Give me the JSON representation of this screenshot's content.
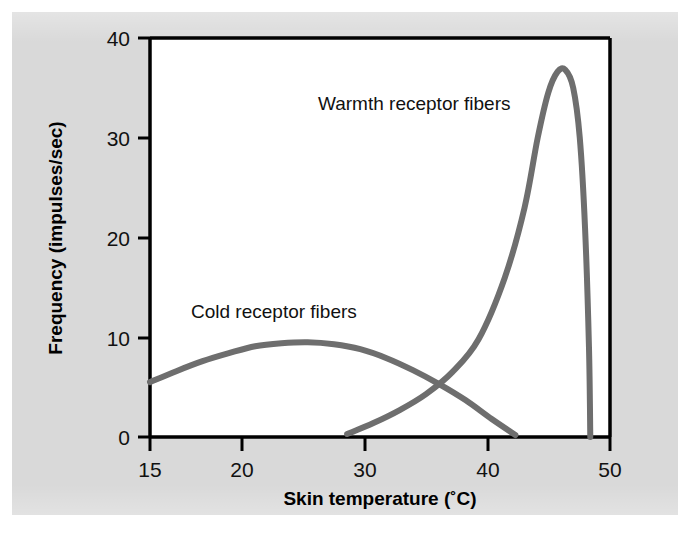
{
  "figure": {
    "background_color": "#ffffff",
    "panel_color": "#d9d9d9",
    "plot_area_color": "#ffffff",
    "axis_color": "#000000",
    "curve_color": "#6e6e6e"
  },
  "chart_data": {
    "type": "line",
    "title": "",
    "xlabel": "Skin temperature (˚C)",
    "ylabel": "Frequency (impulses/sec)",
    "xlim": [
      15,
      50
    ],
    "ylim": [
      0,
      40
    ],
    "xticks": [
      15,
      20,
      30,
      40,
      50
    ],
    "xtick_labels": [
      "15",
      "20",
      "30",
      "40",
      "50"
    ],
    "yticks": [
      0,
      10,
      20,
      30,
      40
    ],
    "ytick_labels": [
      "0",
      "10",
      "20",
      "30",
      "40"
    ],
    "grid": false,
    "legend_position": "inline-annotations",
    "series": [
      {
        "name": "Cold receptor fibers",
        "color": "#6e6e6e",
        "label_x": 24.0,
        "label_y": 13.2,
        "x": [
          15,
          17,
          19,
          21,
          23,
          25,
          27,
          29,
          31,
          33,
          35,
          37,
          39,
          41,
          42.8
        ],
        "y": [
          5.5,
          6.6,
          7.6,
          8.4,
          9.1,
          9.4,
          9.5,
          9.3,
          8.8,
          7.9,
          6.7,
          5.3,
          3.7,
          1.8,
          0.2
        ]
      },
      {
        "name": "Warmth receptor fibers",
        "color": "#6e6e6e",
        "label_x": 32.2,
        "label_y": 34.0,
        "x": [
          30,
          32,
          34,
          36,
          38,
          40,
          42,
          43.5,
          44.5,
          45.3,
          46,
          46.6,
          47.2,
          47.7,
          48.1,
          48.4,
          48.5
        ],
        "y": [
          0.3,
          1.4,
          2.7,
          4.3,
          6.5,
          9.8,
          16.0,
          23.0,
          30.0,
          34.5,
          36.6,
          36.8,
          35.0,
          30.0,
          21.0,
          9.0,
          0.0
        ]
      }
    ],
    "annotations": [
      {
        "text": "Cold receptor fibers",
        "x": 24.0,
        "y": 13.2
      },
      {
        "text": "Warmth receptor fibers",
        "x": 32.2,
        "y": 34.0
      }
    ]
  }
}
